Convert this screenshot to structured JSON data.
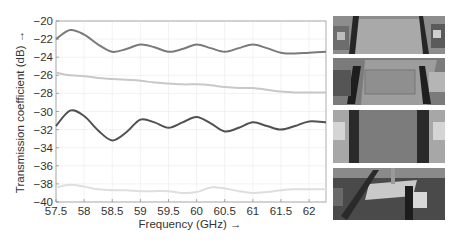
{
  "chart_data": {
    "type": "line",
    "title": "",
    "xlabel": "Frequency (GHz) →",
    "ylabel": "Transmission coefficient (dB) →",
    "xlim": [
      57.5,
      62.3
    ],
    "ylim": [
      -40,
      -20
    ],
    "xticks": [
      57.5,
      58,
      58.5,
      59,
      59.5,
      60,
      60.5,
      61,
      61.5,
      62
    ],
    "xtick_labels": [
      "57.5",
      "58",
      "58.5",
      "59",
      "59.5",
      "60",
      "60.5",
      "61",
      "61.5",
      "62"
    ],
    "yticks": [
      -20,
      -22,
      -24,
      -26,
      -28,
      -30,
      -32,
      -34,
      -36,
      -38,
      -40
    ],
    "ytick_labels": [
      "−20",
      "−22",
      "−24",
      "−26",
      "−28",
      "−30",
      "−32",
      "−34",
      "−36",
      "−38",
      "−40"
    ],
    "grid": true,
    "legend": null,
    "x": [
      57.5,
      57.75,
      58.0,
      58.25,
      58.5,
      58.75,
      59.0,
      59.25,
      59.5,
      59.75,
      60.0,
      60.25,
      60.5,
      60.75,
      61.0,
      61.25,
      61.5,
      61.75,
      62.0,
      62.3
    ],
    "series": [
      {
        "name": "Setup 1",
        "color": "#7a7a7a",
        "values": [
          -22.0,
          -21.0,
          -21.5,
          -22.6,
          -23.4,
          -23.1,
          -22.6,
          -22.9,
          -23.4,
          -23.1,
          -22.6,
          -23.0,
          -23.4,
          -23.0,
          -22.6,
          -23.0,
          -23.5,
          -23.6,
          -23.5,
          -23.4
        ]
      },
      {
        "name": "Setup 2",
        "color": "#c8c8c8",
        "values": [
          -25.7,
          -26.0,
          -26.1,
          -26.3,
          -26.4,
          -26.5,
          -26.6,
          -26.8,
          -26.9,
          -27.0,
          -27.0,
          -27.1,
          -27.3,
          -27.4,
          -27.4,
          -27.6,
          -27.8,
          -27.9,
          -27.9,
          -27.9
        ]
      },
      {
        "name": "Setup 3",
        "color": "#505050",
        "values": [
          -31.6,
          -29.9,
          -30.5,
          -32.1,
          -33.2,
          -32.3,
          -30.9,
          -31.2,
          -31.8,
          -31.2,
          -30.6,
          -31.3,
          -32.2,
          -31.8,
          -31.2,
          -31.6,
          -32.0,
          -31.6,
          -31.1,
          -31.2
        ]
      },
      {
        "name": "Setup 4",
        "color": "#dedede",
        "values": [
          -38.4,
          -38.1,
          -38.3,
          -38.6,
          -38.7,
          -38.7,
          -38.8,
          -38.8,
          -38.8,
          -39.0,
          -38.9,
          -38.4,
          -38.5,
          -38.8,
          -39.0,
          -38.9,
          -38.7,
          -38.6,
          -38.6,
          -38.6
        ]
      }
    ]
  },
  "photos": [
    {
      "label": "measurement setup photo 1"
    },
    {
      "label": "measurement setup photo 2"
    },
    {
      "label": "measurement setup photo 3"
    },
    {
      "label": "measurement setup photo 4"
    }
  ]
}
